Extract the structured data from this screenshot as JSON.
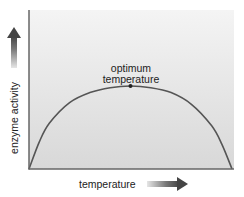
{
  "chart_data": {
    "type": "line",
    "title": "",
    "xlabel": "temperature",
    "ylabel": "enzyme activity",
    "annotation": {
      "line1": "optimum",
      "line2": "temperature",
      "x_rel": 0.5,
      "y_rel": 1.0
    },
    "grid": false,
    "legend": null,
    "x": [
      0.0,
      0.05,
      0.1,
      0.2,
      0.3,
      0.4,
      0.5,
      0.6,
      0.7,
      0.8,
      0.9,
      0.95,
      1.0
    ],
    "series": [
      {
        "name": "enzyme activity",
        "values": [
          0.0,
          0.32,
          0.55,
          0.8,
          0.92,
          0.98,
          1.0,
          0.98,
          0.92,
          0.78,
          0.52,
          0.3,
          0.0
        ]
      }
    ],
    "xlim": [
      0,
      1
    ],
    "ylim": [
      0,
      1.9
    ],
    "ticks": "none",
    "colors": {
      "curve": "#555555",
      "axes": "#666666",
      "plot_bg_top": "#f3f3f3",
      "plot_bg_bottom": "#d9d9d9",
      "arrow_dark": "#555555",
      "arrow_light": "#dddddd",
      "peak_dot": "#222222"
    }
  },
  "labels": {
    "y_axis": "enzyme activity",
    "x_axis": "temperature",
    "annotation_line1": "optimum",
    "annotation_line2": "temperature"
  }
}
